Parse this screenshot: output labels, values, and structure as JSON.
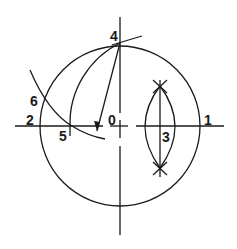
{
  "diagram": {
    "type": "geometric construction",
    "stroke_color": "#1a1a1a",
    "background": "#ffffff",
    "labels": [
      {
        "id": "point-0",
        "text": "0",
        "x": 108,
        "y": 113
      },
      {
        "id": "point-1",
        "text": "1",
        "x": 204,
        "y": 113
      },
      {
        "id": "point-2",
        "text": "2",
        "x": 26,
        "y": 113
      },
      {
        "id": "point-3",
        "text": "3",
        "x": 162,
        "y": 130
      },
      {
        "id": "point-4",
        "text": "4",
        "x": 110,
        "y": 29
      },
      {
        "id": "point-5",
        "text": "5",
        "x": 59,
        "y": 129
      },
      {
        "id": "point-6",
        "text": "6",
        "x": 30,
        "y": 94
      }
    ]
  }
}
